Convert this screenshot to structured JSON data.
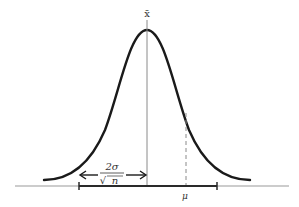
{
  "diagram": {
    "labels": {
      "mean_hat": "x̄",
      "mu": "μ",
      "frac_numerator": "2σ",
      "frac_denominator": "n",
      "frac_root": "√"
    },
    "colors": {
      "curve": "#1a1a1a",
      "axis": "#9a9a9a",
      "center_line": "#8a8a8a",
      "dashed_line": "#8a8a8a",
      "interval": "#2a2a2a",
      "text": "#333333"
    }
  }
}
